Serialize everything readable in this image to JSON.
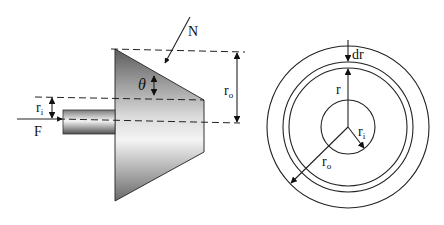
{
  "figure": {
    "left_panel": {
      "title": "Conical clutch cross-section",
      "labels": {
        "normal_force": "N",
        "axial_force": "F",
        "angle": "θ",
        "inner_radius": "r",
        "inner_radius_sub": "i",
        "outer_radius": "r",
        "outer_radius_sub": "o"
      }
    },
    "right_panel": {
      "title": "Annular friction surface",
      "labels": {
        "element_width": "dr",
        "radius": "r",
        "inner_radius": "r",
        "inner_radius_sub": "i",
        "outer_radius": "r",
        "outer_radius_sub": "o"
      }
    },
    "colors": {
      "stroke": "#222222",
      "cone_dark": "#6e6e6e",
      "cone_light": "#f2f2f2",
      "background": "#ffffff"
    }
  }
}
